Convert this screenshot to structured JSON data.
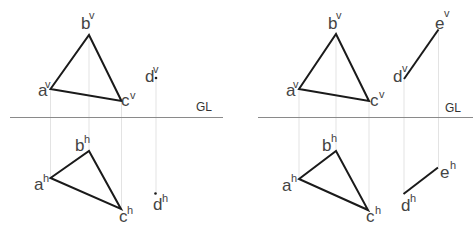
{
  "diagram": {
    "reference_line_label": "GL",
    "colors": {
      "edge": "#1a1a1a",
      "reference_line": "#8a8a8a",
      "projector": "#dcdcdc",
      "label": "#444444"
    },
    "left_panel": {
      "gl_label": "GL",
      "points": {
        "a_v": {
          "base": "a",
          "sup": "v"
        },
        "b_v": {
          "base": "b",
          "sup": "v"
        },
        "c_v": {
          "base": "c",
          "sup": "v"
        },
        "d_v": {
          "base": "d",
          "sup": "v"
        },
        "a_h": {
          "base": "a",
          "sup": "h"
        },
        "b_h": {
          "base": "b",
          "sup": "h"
        },
        "c_h": {
          "base": "c",
          "sup": "h"
        },
        "d_h": {
          "base": "d",
          "sup": "h"
        }
      }
    },
    "right_panel": {
      "gl_label": "GL",
      "points": {
        "a_v": {
          "base": "a",
          "sup": "v"
        },
        "b_v": {
          "base": "b",
          "sup": "v"
        },
        "c_v": {
          "base": "c",
          "sup": "v"
        },
        "d_v": {
          "base": "d",
          "sup": "v"
        },
        "e_v": {
          "base": "e",
          "sup": "v"
        },
        "a_h": {
          "base": "a",
          "sup": "h"
        },
        "b_h": {
          "base": "b",
          "sup": "h"
        },
        "c_h": {
          "base": "c",
          "sup": "h"
        },
        "d_h": {
          "base": "d",
          "sup": "h"
        },
        "e_h": {
          "base": "e",
          "sup": "h"
        }
      }
    }
  }
}
